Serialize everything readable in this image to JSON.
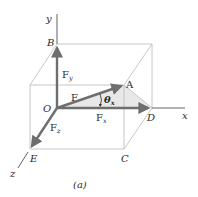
{
  "figure": {
    "caption": "(a)",
    "axes": {
      "x": "x",
      "y": "y",
      "z": "z"
    },
    "points": {
      "O": "O",
      "A": "A",
      "B": "B",
      "C": "C",
      "D": "D",
      "E": "E"
    },
    "vectors": {
      "F": {
        "label": "F",
        "sub": ""
      },
      "Fx": {
        "label": "F",
        "sub": "x"
      },
      "Fy": {
        "label": "F",
        "sub": "y"
      },
      "Fz": {
        "label": "F",
        "sub": "z"
      }
    },
    "angle": {
      "symbol": "θ",
      "sub": "x"
    },
    "colors": {
      "box_edge": "#b8b8b8",
      "axis": "#3a3a3a",
      "vector": "#6e6e6e",
      "shade": "#e6e6e6",
      "text": "#2a2a2a"
    }
  }
}
